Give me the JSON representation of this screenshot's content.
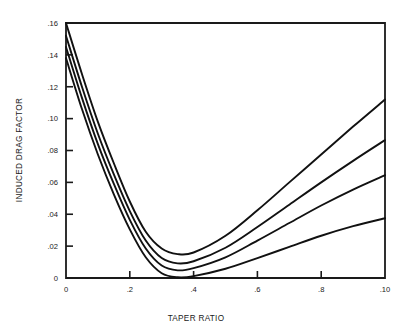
{
  "chart_data": {
    "type": "line",
    "title": "",
    "xlabel": "TAPER RATIO",
    "ylabel": "INDUCED DRAG FACTOR",
    "xlim": [
      0,
      1.0
    ],
    "ylim": [
      0,
      0.16
    ],
    "grid": false,
    "legend_position": "none",
    "xticks": [
      0,
      0.2,
      0.4,
      0.6,
      0.8,
      1.0
    ],
    "xticklabels": [
      "0",
      ".2",
      ".4",
      ".6",
      ".8",
      ".10"
    ],
    "yticks": [
      0,
      0.02,
      0.04,
      0.06,
      0.08,
      0.1,
      0.12,
      0.14,
      0.16
    ],
    "yticklabels": [
      "0",
      ".02",
      ".04",
      ".06",
      ".08",
      ".10",
      ".12",
      ".14",
      ".16"
    ],
    "x": [
      0,
      0.05,
      0.1,
      0.15,
      0.2,
      0.25,
      0.3,
      0.35,
      0.4,
      0.5,
      0.6,
      0.7,
      0.8,
      0.9,
      1.0
    ],
    "series": [
      {
        "name": "curve-1",
        "values": [
          0.16,
          0.128,
          0.098,
          0.072,
          0.048,
          0.029,
          0.0185,
          0.015,
          0.016,
          0.0265,
          0.0425,
          0.06,
          0.0775,
          0.095,
          0.112
        ]
      },
      {
        "name": "curve-2",
        "values": [
          0.152,
          0.12,
          0.0905,
          0.065,
          0.042,
          0.0235,
          0.0125,
          0.0092,
          0.0105,
          0.019,
          0.032,
          0.046,
          0.06,
          0.0735,
          0.0865
        ]
      },
      {
        "name": "curve-3",
        "values": [
          0.145,
          0.113,
          0.084,
          0.059,
          0.0365,
          0.0185,
          0.0078,
          0.0048,
          0.0062,
          0.013,
          0.0235,
          0.0345,
          0.0455,
          0.0555,
          0.0645
        ]
      },
      {
        "name": "curve-4",
        "values": [
          0.138,
          0.106,
          0.0775,
          0.0525,
          0.0305,
          0.013,
          0.003,
          0.0005,
          0.0012,
          0.0058,
          0.0125,
          0.0195,
          0.0265,
          0.0325,
          0.0375
        ]
      }
    ]
  },
  "colors": {
    "curve": "#111111",
    "axis": "#1a1a1a",
    "background": "#ffffff"
  }
}
